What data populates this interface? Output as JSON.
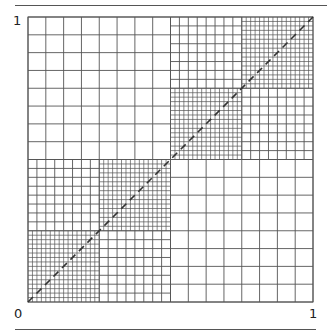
{
  "figure": {
    "type": "hierarchical-grid",
    "labels": {
      "y_top": "1",
      "origin": "0",
      "x_right": "1"
    },
    "grid": {
      "origin_px": [
        28,
        302
      ],
      "size_px": 285,
      "quadrants": [
        {
          "name": "top-left",
          "cells": 8
        },
        {
          "name": "bottom-right",
          "cells": 8
        },
        {
          "name": "top-right",
          "sub": [
            {
              "name": "tl",
              "cells": 8
            },
            {
              "name": "tr",
              "cells": 16
            },
            {
              "name": "bl",
              "cells": 16
            },
            {
              "name": "br",
              "cells": 8
            }
          ]
        },
        {
          "name": "bottom-left",
          "sub": [
            {
              "name": "tl",
              "cells": 8
            },
            {
              "name": "tr",
              "cells": 16
            },
            {
              "name": "bl",
              "cells": 16
            },
            {
              "name": "br",
              "cells": 8
            }
          ]
        }
      ],
      "line_color": "#555555",
      "diagonal": {
        "style": "dashed",
        "color": "#333333",
        "from": [
          0,
          0
        ],
        "to": [
          1,
          1
        ]
      }
    }
  }
}
